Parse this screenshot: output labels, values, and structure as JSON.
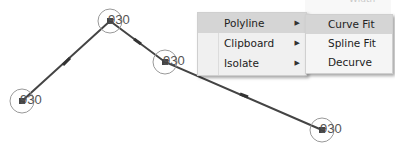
{
  "drawing": {
    "polyline_color": "#444444",
    "circle_color": "#999999",
    "vertices": [
      {
        "x": 22,
        "y": 101,
        "label": "930"
      },
      {
        "x": 110,
        "y": 21,
        "label": "930"
      },
      {
        "x": 165,
        "y": 62,
        "label": "930"
      },
      {
        "x": 322,
        "y": 130,
        "label": "930"
      }
    ]
  },
  "context_menu": {
    "items": [
      {
        "label": "Polyline",
        "has_submenu": true,
        "highlighted": true
      },
      {
        "label": "Clipboard",
        "has_submenu": true,
        "highlighted": false
      },
      {
        "label": "Isolate",
        "has_submenu": true,
        "highlighted": false
      }
    ],
    "arrow_glyph": "▶"
  },
  "submenu": {
    "partial_top_item": "Width",
    "items": [
      {
        "label": "Curve Fit",
        "highlighted": true
      },
      {
        "label": "Spline Fit",
        "highlighted": false
      },
      {
        "label": "Decurve",
        "highlighted": false
      }
    ]
  }
}
